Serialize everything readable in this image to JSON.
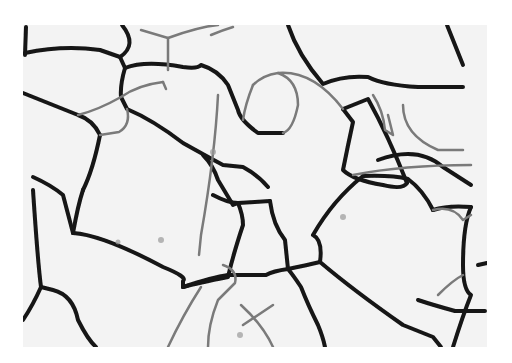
{
  "image": {
    "description": "Grayscale optical micrograph showing polygonal grain boundaries",
    "background_color": "#f4f4f4",
    "boundary_dark": "#151515",
    "boundary_light": "#8a8a8a"
  }
}
